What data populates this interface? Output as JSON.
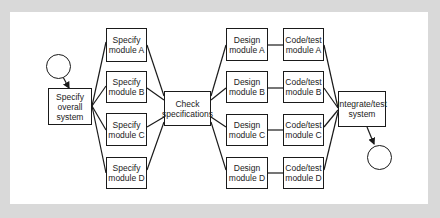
{
  "diagram": {
    "start_node": {
      "label": ""
    },
    "end_node": {
      "label": ""
    },
    "nodes": {
      "specify_overall": "Specify\noverall\nsystem",
      "specify_a": "Specify\nmodule A",
      "specify_b": "Specify\nmodule B",
      "specify_c": "Specify\nmodule C",
      "specify_d": "Specify\nmodule D",
      "check": "Check\nspecifications",
      "design_a": "Design\nmodule A",
      "design_b": "Design\nmodule B",
      "design_c": "Design\nmodule C",
      "design_d": "Design\nmodule D",
      "code_a": "Code/test\nmodule A",
      "code_b": "Code/test\nmodule B",
      "code_c": "Code/test\nmodule C",
      "code_d": "Code/test\nmodule D",
      "integrate": "Integrate/test\nsystem"
    },
    "edges": [
      [
        "start",
        "specify_overall"
      ],
      [
        "specify_overall",
        "specify_a"
      ],
      [
        "specify_overall",
        "specify_b"
      ],
      [
        "specify_overall",
        "specify_c"
      ],
      [
        "specify_overall",
        "specify_d"
      ],
      [
        "specify_a",
        "check"
      ],
      [
        "specify_b",
        "check"
      ],
      [
        "specify_c",
        "check"
      ],
      [
        "specify_d",
        "check"
      ],
      [
        "check",
        "design_a"
      ],
      [
        "check",
        "design_b"
      ],
      [
        "check",
        "design_c"
      ],
      [
        "check",
        "design_d"
      ],
      [
        "design_a",
        "code_a"
      ],
      [
        "design_b",
        "code_b"
      ],
      [
        "design_c",
        "code_c"
      ],
      [
        "design_d",
        "code_d"
      ],
      [
        "code_a",
        "integrate"
      ],
      [
        "code_b",
        "integrate"
      ],
      [
        "code_c",
        "integrate"
      ],
      [
        "code_d",
        "integrate"
      ],
      [
        "integrate",
        "end"
      ]
    ],
    "colors": {
      "background": "#d9d9d9",
      "panel": "#ffffff",
      "stroke": "#1a1a1a"
    }
  }
}
